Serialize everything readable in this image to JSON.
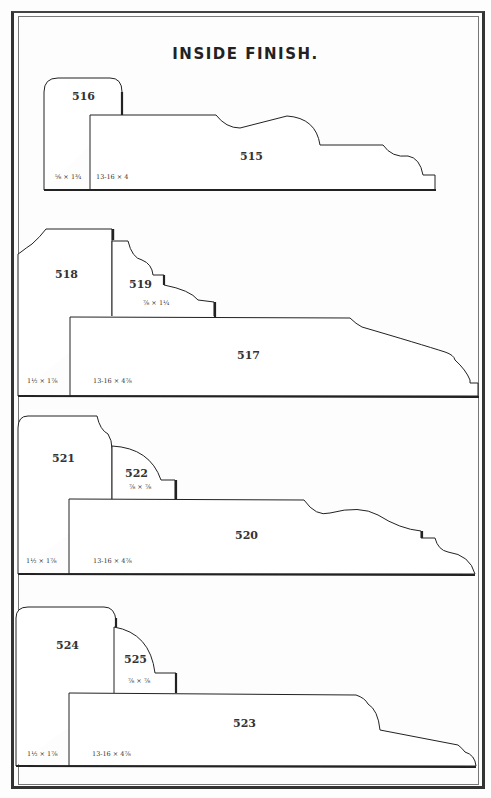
{
  "page": {
    "title": "INSIDE FINISH."
  },
  "groups": [
    {
      "moldings": [
        {
          "number": "516",
          "size": "⅝ × 1¾"
        },
        {
          "number": "515",
          "size": "13-16 × 4"
        }
      ]
    },
    {
      "moldings": [
        {
          "number": "518",
          "size": "1½ × 1⅞"
        },
        {
          "number": "519",
          "size": "⅞ × 1¼"
        },
        {
          "number": "517",
          "size": "13-16 × 4⅞"
        }
      ]
    },
    {
      "moldings": [
        {
          "number": "521",
          "size": "1½ × 1⅞"
        },
        {
          "number": "522",
          "size": "⅞ × ⅞"
        },
        {
          "number": "520",
          "size": "13-16 × 4⅞"
        }
      ]
    },
    {
      "moldings": [
        {
          "number": "524",
          "size": "1½ × 1⅞"
        },
        {
          "number": "525",
          "size": "⅞ × ⅞"
        },
        {
          "number": "523",
          "size": "13-16 × 4⅞"
        }
      ]
    }
  ],
  "colors": {
    "ink": "#222222",
    "paper": "#fdfdfd",
    "border": "#333333"
  }
}
